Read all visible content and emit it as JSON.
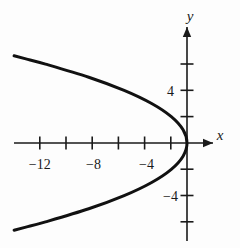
{
  "figure": {
    "background_color": "#fdfdfd",
    "ink_color": "#1a1a1a",
    "width": 240,
    "height": 248
  },
  "axes": {
    "x_axis_label": "x",
    "y_axis_label": "y",
    "x_arrow": "arrow-right",
    "y_arrow": "arrow-up"
  },
  "chart_data": {
    "type": "line",
    "title": "",
    "subtitle": "",
    "xlabel": "x",
    "ylabel": "y",
    "xlim": [
      -14.5,
      2.5
    ],
    "ylim": [
      -7.5,
      7.5
    ],
    "grid": false,
    "legend": "none",
    "x_tick_values": [
      -12,
      -10,
      -8,
      -6,
      -4,
      -2
    ],
    "x_tick_labels": [
      "-12",
      "",
      "-8",
      "",
      "-4",
      ""
    ],
    "x_labeled_ticks": [
      {
        "value": -12,
        "label": "−12"
      },
      {
        "value": -8,
        "label": "−8"
      },
      {
        "value": -4,
        "label": "−4"
      }
    ],
    "y_tick_values": [
      6,
      4,
      2,
      -2,
      -4,
      -6
    ],
    "y_tick_labels": [
      "",
      "4",
      "",
      "",
      "-4",
      ""
    ],
    "y_labeled_ticks": [
      {
        "value": 4,
        "label": "4"
      },
      {
        "value": -4,
        "label": "−4"
      }
    ],
    "tick_spacing_units": 2,
    "curve": {
      "name": "parabola",
      "equation": "x = -0.3 y^2",
      "orientation": "opens-left",
      "vertex": [
        0,
        0
      ],
      "color": "#111111",
      "line_width": 3,
      "x": [
        0,
        -0.3,
        -1.2,
        -2.7,
        -4.8,
        -7.5,
        -10.8,
        -12.3,
        -13.2
      ],
      "y_upper": [
        0,
        1,
        2,
        3,
        4,
        5,
        6,
        6.4,
        6.63
      ],
      "y_lower": [
        0,
        -1,
        -2,
        -3,
        -4,
        -5,
        -6,
        -6.4,
        -6.63
      ],
      "points_upper": [
        [
          0,
          0
        ],
        [
          -0.3,
          1
        ],
        [
          -1.2,
          2
        ],
        [
          -2.7,
          3
        ],
        [
          -4.8,
          4
        ],
        [
          -7.5,
          5
        ],
        [
          -10.8,
          6
        ],
        [
          -12.3,
          6.4
        ],
        [
          -13.2,
          6.63
        ]
      ],
      "points_lower": [
        [
          0,
          0
        ],
        [
          -0.3,
          -1
        ],
        [
          -1.2,
          -2
        ],
        [
          -2.7,
          -3
        ],
        [
          -4.8,
          -4
        ],
        [
          -7.5,
          -5
        ],
        [
          -10.8,
          -6
        ],
        [
          -12.3,
          -6.4
        ],
        [
          -13.2,
          -6.63
        ]
      ]
    }
  }
}
